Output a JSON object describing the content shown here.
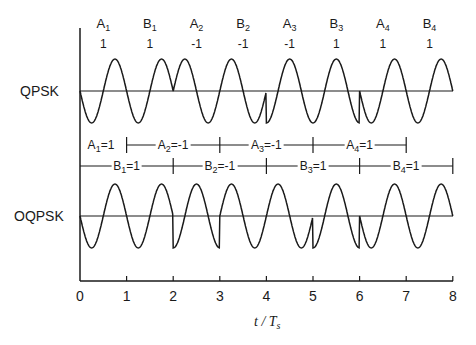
{
  "labels": {
    "top": "QPSK",
    "bottom": "OQPSK"
  },
  "xlabel": {
    "t": "t / T",
    "sub": "s"
  },
  "symbols_top": [
    {
      "name": "A",
      "sub": "1",
      "value": "1",
      "x": 0.5
    },
    {
      "name": "B",
      "sub": "1",
      "value": "1",
      "x": 1.5
    },
    {
      "name": "A",
      "sub": "2",
      "value": "-1",
      "x": 2.5
    },
    {
      "name": "B",
      "sub": "2",
      "value": "-1",
      "x": 3.5
    },
    {
      "name": "A",
      "sub": "3",
      "value": "-1",
      "x": 4.5
    },
    {
      "name": "B",
      "sub": "3",
      "value": "1",
      "x": 5.5
    },
    {
      "name": "A",
      "sub": "4",
      "value": "1",
      "x": 6.5
    },
    {
      "name": "B",
      "sub": "4",
      "value": "1",
      "x": 7.5
    }
  ],
  "a_row": [
    {
      "name": "A",
      "sub": "1",
      "eq": "=1",
      "x": 0.45
    },
    {
      "name": "A",
      "sub": "2",
      "eq": "=-1",
      "x": 2.0
    },
    {
      "name": "A",
      "sub": "3",
      "eq": "=-1",
      "x": 4.0
    },
    {
      "name": "A",
      "sub": "4",
      "eq": "=1",
      "x": 6.0
    }
  ],
  "b_row": [
    {
      "name": "B",
      "sub": "1",
      "eq": "=1",
      "x": 1.0
    },
    {
      "name": "B",
      "sub": "2",
      "eq": "=-1",
      "x": 3.0
    },
    {
      "name": "B",
      "sub": "3",
      "eq": "=1",
      "x": 5.0
    },
    {
      "name": "B",
      "sub": "4",
      "eq": "=1",
      "x": 7.0
    }
  ],
  "x_ticks": [
    "0",
    "1",
    "2",
    "3",
    "4",
    "5",
    "6",
    "7",
    "8"
  ],
  "chart_data": {
    "type": "line",
    "title": "",
    "xlabel": "t / Ts",
    "xlim": [
      0,
      8
    ],
    "x_ticks": [
      0,
      1,
      2,
      3,
      4,
      5,
      6,
      7,
      8
    ],
    "series": [
      {
        "name": "QPSK",
        "A": [
          1,
          -1,
          -1,
          1
        ],
        "B": [
          1,
          -1,
          1,
          1
        ],
        "symbol_period": 2,
        "offset": 0
      },
      {
        "name": "OQPSK",
        "A": [
          1,
          -1,
          -1,
          1
        ],
        "B": [
          1,
          -1,
          1,
          1
        ],
        "symbol_period": 2,
        "offset": 1
      }
    ],
    "bit_boundaries_A": [
      1,
      3,
      5,
      7
    ],
    "bit_boundaries_B": [
      2,
      4,
      6,
      8
    ]
  }
}
